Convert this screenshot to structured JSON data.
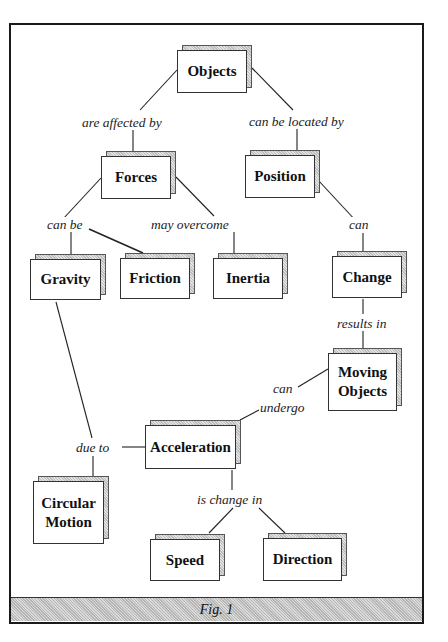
{
  "diagram": {
    "type": "concept-map",
    "nodes": {
      "objects": "Objects",
      "forces": "Forces",
      "position": "Position",
      "gravity": "Gravity",
      "friction": "Friction",
      "inertia": "Inertia",
      "change": "Change",
      "moving_objects": "Moving\nObjects",
      "acceleration": "Acceleration",
      "circular_motion": "Circular\nMotion",
      "speed": "Speed",
      "direction": "Direction"
    },
    "links": {
      "are_affected_by": "are affected by",
      "can_be_located_by": "can be located by",
      "can_be": "can be",
      "may_overcome": "may overcome",
      "can": "can",
      "results_in": "results in",
      "can_undergo_1": "can",
      "can_undergo_2": "undergo",
      "due_to": "due to",
      "is_change_in": "is change in"
    },
    "edges": [
      {
        "from": "Objects",
        "label": "are affected by",
        "to": "Forces"
      },
      {
        "from": "Objects",
        "label": "can be located by",
        "to": "Position"
      },
      {
        "from": "Forces",
        "label": "can be",
        "to": "Gravity"
      },
      {
        "from": "Forces",
        "label": "can be",
        "to": "Friction"
      },
      {
        "from": "Forces",
        "label": "may overcome",
        "to": "Inertia"
      },
      {
        "from": "Position",
        "label": "can",
        "to": "Change"
      },
      {
        "from": "Change",
        "label": "results in",
        "to": "Moving Objects"
      },
      {
        "from": "Moving Objects",
        "label": "can undergo",
        "to": "Acceleration"
      },
      {
        "from": "Gravity",
        "label": "due to",
        "to": "Circular Motion"
      },
      {
        "from": "Acceleration",
        "label": "due to",
        "to": "Circular Motion"
      },
      {
        "from": "Acceleration",
        "label": "is change in",
        "to": "Speed"
      },
      {
        "from": "Acceleration",
        "label": "is change in",
        "to": "Direction"
      }
    ],
    "caption": "Fig. 1"
  }
}
